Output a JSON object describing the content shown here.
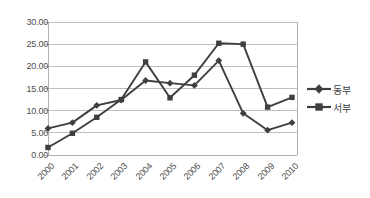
{
  "chart_data": {
    "type": "line",
    "title": "",
    "xlabel": "",
    "ylabel": "",
    "categories": [
      "2000",
      "2001",
      "2002",
      "2003",
      "2004",
      "2005",
      "2006",
      "2007",
      "2008",
      "2009",
      "2010"
    ],
    "series": [
      {
        "name": "동부",
        "marker": "diamond",
        "color": "#3f3f3f",
        "values": [
          6.0,
          7.3,
          11.2,
          12.4,
          16.8,
          16.2,
          15.7,
          21.3,
          9.4,
          5.6,
          7.3
        ]
      },
      {
        "name": "서부",
        "marker": "square",
        "color": "#3f3f3f",
        "values": [
          1.7,
          4.9,
          8.5,
          12.5,
          21.0,
          12.9,
          18.0,
          25.2,
          25.0,
          10.8,
          13.0
        ]
      }
    ],
    "ylim": [
      0,
      30
    ],
    "ytick_values": [
      0,
      5,
      10,
      15,
      20,
      25,
      30
    ],
    "ytick_labels": [
      "0.00",
      "5.00",
      "10.00",
      "15.00",
      "20.00",
      "25.00",
      "30.00"
    ],
    "grid": true,
    "grid_axis": "y",
    "legend_position": "right",
    "axis_color": "#b0b0b0",
    "grid_color": "#bfbfbf",
    "background": "#ffffff"
  },
  "legend": {
    "items": [
      {
        "label": "동부",
        "marker": "diamond"
      },
      {
        "label": "서부",
        "marker": "square"
      }
    ]
  }
}
